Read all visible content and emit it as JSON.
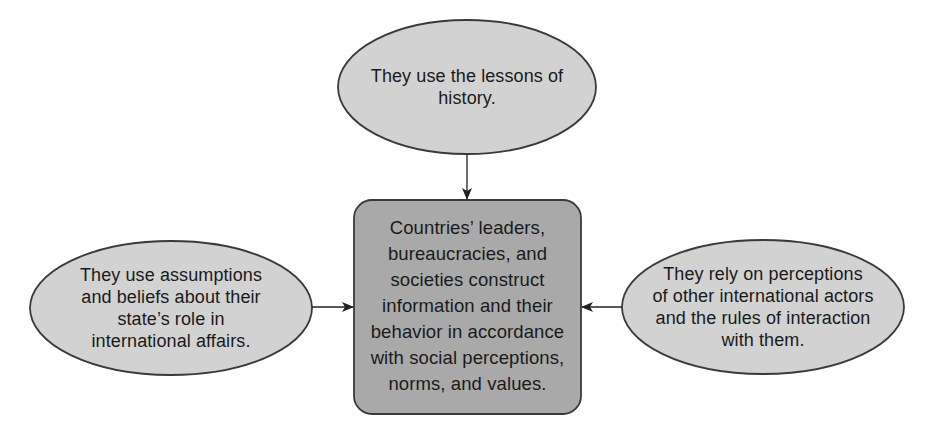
{
  "diagram": {
    "colors": {
      "ellipse_fill": "#d2d2d2",
      "box_fill": "#a9a9a9",
      "stroke": "#3a3a3a",
      "text": "#1a1a1a",
      "background": "#ffffff"
    },
    "center": {
      "lines": [
        "Countries’ leaders,",
        "bureaucracies, and",
        "societies construct",
        "information and their",
        "behavior in accordance",
        "with social perceptions,",
        "norms, and values."
      ]
    },
    "top": {
      "lines": [
        "They use the lessons of",
        "history."
      ]
    },
    "left": {
      "lines": [
        "They use assumptions",
        "and beliefs about their",
        "state’s role in",
        "international affairs."
      ]
    },
    "right": {
      "lines": [
        "They rely on perceptions",
        "of other international actors",
        "and the rules of interaction",
        "with them."
      ]
    },
    "edges": [
      {
        "from": "top",
        "to": "center"
      },
      {
        "from": "left",
        "to": "center"
      },
      {
        "from": "right",
        "to": "center"
      }
    ]
  }
}
